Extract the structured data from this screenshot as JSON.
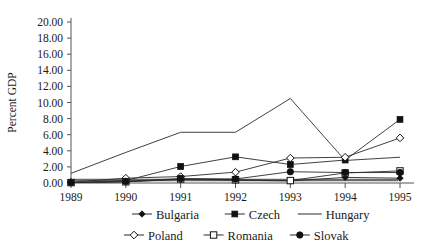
{
  "chart_data": {
    "type": "line",
    "title": "",
    "xlabel": "",
    "ylabel": "Percent GDP",
    "x": [
      1989,
      1990,
      1991,
      1992,
      1993,
      1994,
      1995
    ],
    "xtick_labels": [
      "1989",
      "1990",
      "1991",
      "1992",
      "1993",
      "1994",
      "1995"
    ],
    "ylim": [
      0.0,
      20.0
    ],
    "ytick_labels": [
      "0.00",
      "2.00",
      "4.00",
      "6.00",
      "8.00",
      "10.00",
      "12.00",
      "14.00",
      "16.00",
      "18.00",
      "20.00"
    ],
    "ytick_values": [
      0.0,
      2.0,
      4.0,
      6.0,
      8.0,
      10.0,
      12.0,
      14.0,
      16.0,
      18.0,
      20.0
    ],
    "grid": false,
    "legend_position": "bottom",
    "series": [
      {
        "name": "Bulgaria",
        "marker": "filled-diamond",
        "values": [
          0.05,
          0.15,
          0.45,
          0.35,
          0.25,
          0.7,
          0.6
        ]
      },
      {
        "name": "Czech",
        "marker": "filled-square",
        "values": [
          0.05,
          0.3,
          2.05,
          3.25,
          2.3,
          2.85,
          7.9
        ]
      },
      {
        "name": "Hungary",
        "marker": "none",
        "values": [
          1.2,
          3.8,
          6.3,
          6.3,
          10.5,
          2.8,
          3.2
        ]
      },
      {
        "name": "Poland",
        "marker": "open-diamond",
        "values": [
          0.1,
          0.6,
          0.8,
          1.35,
          3.1,
          3.2,
          5.6
        ]
      },
      {
        "name": "Romania",
        "marker": "open-square",
        "values": [
          0.05,
          0.15,
          0.5,
          0.4,
          0.3,
          1.25,
          1.5
        ]
      },
      {
        "name": "Slovak",
        "marker": "filled-circle",
        "values": [
          0.05,
          0.2,
          0.55,
          0.5,
          1.4,
          1.3,
          1.3
        ]
      }
    ]
  },
  "legend": {
    "row1": [
      {
        "label": "Bulgaria",
        "marker": "filled-diamond"
      },
      {
        "label": "Czech",
        "marker": "filled-square"
      },
      {
        "label": "Hungary",
        "marker": "none"
      }
    ],
    "row2": [
      {
        "label": "Poland",
        "marker": "open-diamond"
      },
      {
        "label": "Romania",
        "marker": "open-square"
      },
      {
        "label": "Slovak",
        "marker": "filled-circle"
      }
    ]
  }
}
